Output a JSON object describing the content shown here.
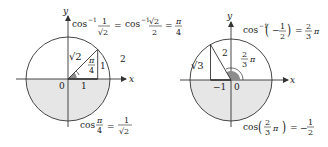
{
  "colors": {
    "ink": "#222222",
    "shade": "#e6e6e6",
    "angle_fill": "#8c8c8c",
    "stroke": "#333333"
  },
  "left_diagram": {
    "axis_x_label": "x",
    "axis_y_label": "y",
    "origin_label": "0",
    "adjacent_label": "1",
    "opposite_label": "1",
    "hypotenuse_label": "√2",
    "angle_label_num": "π",
    "angle_label_den": "4",
    "side_label": "2",
    "top_equation": {
      "lhs_func": "cos",
      "lhs_exp": "−1",
      "lhs_num": "1",
      "lhs_den": "√2",
      "eq": "=",
      "mid_func": "cos",
      "mid_exp": "−1",
      "mid_num": "√2",
      "mid_den": "2",
      "eq2": "=",
      "rhs_num": "π",
      "rhs_den": "4"
    },
    "bottom_equation": {
      "func": "cos",
      "arg_num": "π",
      "arg_den": "4",
      "eq": "=",
      "rhs_num": "1",
      "rhs_den": "√2"
    }
  },
  "right_diagram": {
    "axis_x_label": "x",
    "axis_y_label": "y",
    "origin_label": "0",
    "neg_one_label": "−1",
    "hypotenuse_label": "2",
    "opposite_label": "√3",
    "angle_label_num": "2",
    "angle_label_den": "3",
    "angle_label_pi": "π",
    "top_equation": {
      "func": "cos",
      "exp": "−1",
      "lparen": "(",
      "sign": "−",
      "num": "1",
      "den": "2",
      "rparen": ")",
      "eq": "=",
      "rhs_num": "2",
      "rhs_den": "3",
      "rhs_pi": "π"
    },
    "bottom_equation": {
      "func": "cos",
      "lparen": "(",
      "num": "2",
      "den": "3",
      "pi": "π",
      "rparen": ")",
      "eq": "=",
      "sign": "−",
      "rhs_num": "1",
      "rhs_den": "2"
    }
  }
}
